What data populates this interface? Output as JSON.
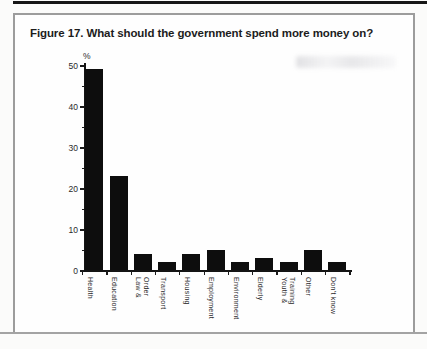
{
  "figure": {
    "title": "Figure 17. What should the government spend more money on?"
  },
  "chart_data": {
    "type": "bar",
    "title": "Figure 17. What should the government spend more money on?",
    "xlabel": "",
    "ylabel": "%",
    "ylim": [
      0,
      50
    ],
    "yticks": [
      0,
      10,
      20,
      30,
      40,
      50
    ],
    "y_minor_tick_step": 5,
    "grid": false,
    "legend": "none",
    "bar_color": "#0d0d0d",
    "axis_color": "#141414",
    "categories": [
      "Health",
      "Education",
      "Law &\nOrder",
      "Transport",
      "Housing",
      "Employment",
      "Environment",
      "Elderly",
      "Youth &\nTraining",
      "Other",
      "Don't know"
    ],
    "values": [
      49,
      23,
      4,
      2,
      4,
      5,
      2,
      3,
      2,
      5,
      2
    ]
  }
}
